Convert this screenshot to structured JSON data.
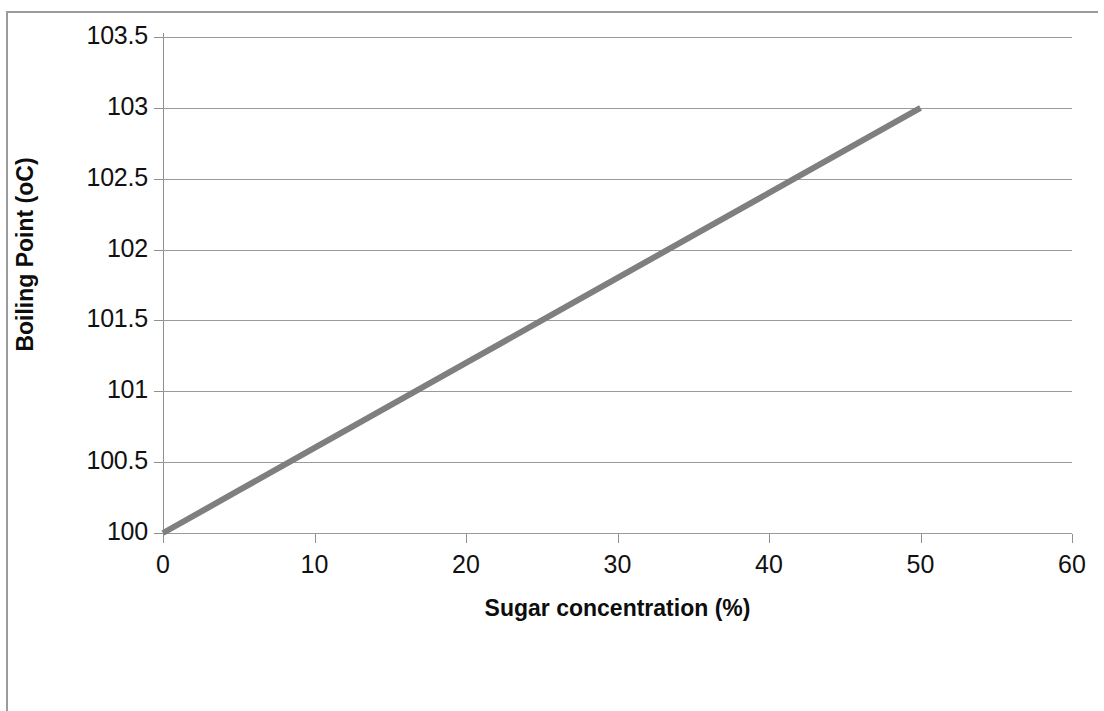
{
  "chart_data": {
    "type": "line",
    "title": "",
    "subtitle": "",
    "xlabel": "Sugar concentration (%)",
    "ylabel": "Boiling Point  (oC)",
    "xlim": [
      0,
      60
    ],
    "ylim": [
      100,
      103.5
    ],
    "xticks": [
      0,
      10,
      20,
      30,
      40,
      50,
      60
    ],
    "xticklabels": [
      "0",
      "10",
      "20",
      "30",
      "40",
      "50",
      "60"
    ],
    "yticks": [
      100,
      100.5,
      101,
      101.5,
      102,
      102.5,
      103,
      103.5
    ],
    "yticklabels": [
      "100",
      "100.5",
      "101",
      "101.5",
      "102",
      "102.5",
      "103",
      "103.5"
    ],
    "grid": "horizontal",
    "legend": "none",
    "series": [
      {
        "name": "Boiling point",
        "color": "#7f7f7f",
        "line_width": 6,
        "markers": "none",
        "x": [
          0,
          5,
          10,
          15,
          20,
          25,
          30,
          35,
          40,
          45,
          50
        ],
        "values": [
          100.0,
          100.3,
          100.6,
          100.9,
          101.2,
          101.5,
          101.8,
          102.1,
          102.4,
          102.7,
          103.0
        ]
      }
    ],
    "annotations": []
  },
  "style": {
    "background": "#ffffff",
    "gridline_color": "#9a9a9a",
    "axis_color": "#8f8f8f",
    "text_color": "#111111",
    "frame_color": "#9b9b9b",
    "series_color": "#7f7f7f"
  }
}
